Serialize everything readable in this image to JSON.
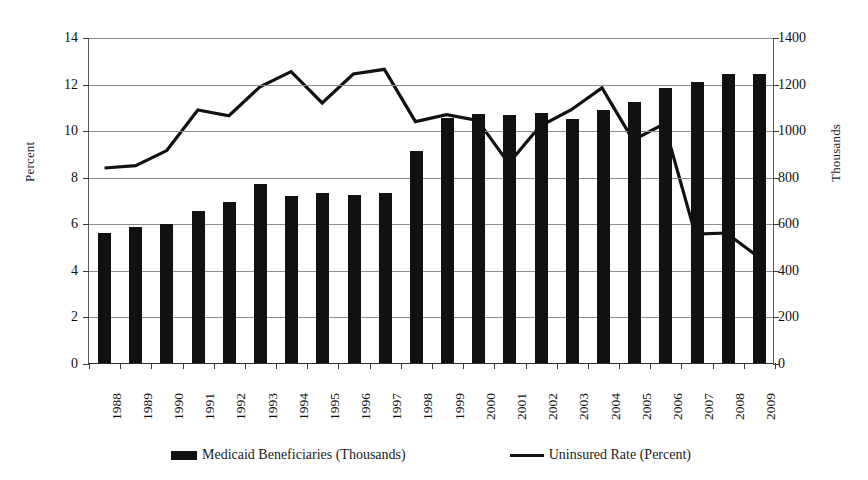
{
  "chart_data": {
    "type": "bar",
    "title": "",
    "subtitle": "",
    "xlabel": "",
    "ylabel": "Percent",
    "y2label": "Thousands",
    "ylim": [
      0,
      14
    ],
    "y2lim": [
      0,
      1400
    ],
    "yticks": [
      0,
      2,
      4,
      6,
      8,
      10,
      12,
      14
    ],
    "y2ticks": [
      0,
      200,
      400,
      600,
      800,
      1000,
      1200,
      1400
    ],
    "grid": true,
    "legend_position": "bottom",
    "categories": [
      "1988",
      "1989",
      "1990",
      "1991",
      "1992",
      "1993",
      "1994",
      "1995",
      "1996",
      "1997",
      "1998",
      "1999",
      "2000",
      "2001",
      "2002",
      "2003",
      "2004",
      "2005",
      "2006",
      "2007",
      "2008",
      "2009"
    ],
    "series": [
      {
        "name": "Medicaid Beneficiaries (Thousands)",
        "type": "bar",
        "axis": "right",
        "color": "#111111",
        "values": [
          558,
          585,
          596,
          651,
          690,
          769,
          716,
          732,
          722,
          731,
          911,
          1053,
          1071,
          1064,
          1074,
          1049,
          1085,
          1120,
          1180,
          1205,
          1240,
          1240
        ]
      },
      {
        "name": "Uninsured Rate (Percent)",
        "type": "line",
        "axis": "left",
        "color": "#111111",
        "values": [
          8.4,
          8.5,
          9.15,
          10.9,
          10.65,
          11.9,
          12.55,
          11.2,
          12.45,
          12.65,
          10.4,
          10.7,
          10.45,
          8.6,
          10.2,
          10.9,
          11.85,
          9.6,
          10.3,
          5.55,
          5.6,
          4.6
        ]
      }
    ]
  },
  "legend": {
    "items": [
      {
        "label": "Medicaid Beneficiaries (Thousands)",
        "marker": "bar-swatch-icon"
      },
      {
        "label": "Uninsured Rate (Percent)",
        "marker": "line-swatch-icon"
      }
    ]
  }
}
